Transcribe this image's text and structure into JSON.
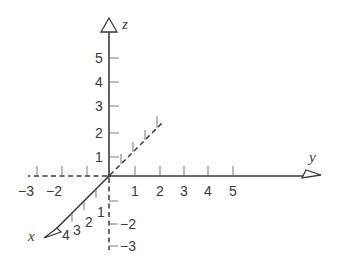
{
  "diagram": {
    "axes": {
      "x": {
        "label": "x",
        "positive_tick_labels": [
          "1",
          "2",
          "3",
          "4"
        ]
      },
      "y": {
        "label": "y",
        "positive_tick_labels": [
          "1",
          "2",
          "3",
          "4",
          "5"
        ],
        "negative_tick_labels": [
          "-3",
          "-2"
        ]
      },
      "z": {
        "label": "z",
        "positive_tick_labels": [
          "1",
          "2",
          "3",
          "4",
          "5"
        ],
        "negative_tick_labels": [
          "-2",
          "-3"
        ]
      }
    },
    "minus_sign": "−"
  }
}
